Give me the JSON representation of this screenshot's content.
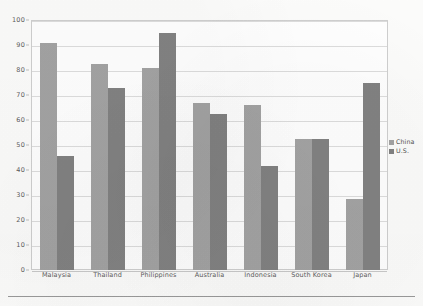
{
  "chart_data": {
    "type": "bar",
    "title": "",
    "subtitle": "",
    "xlabel": "",
    "ylabel": "",
    "ylim": [
      0,
      100
    ],
    "ytick_step": 10,
    "ytick_labels": [
      "0",
      "10",
      "20",
      "30",
      "40",
      "50",
      "60",
      "70",
      "80",
      "90",
      "100"
    ],
    "grid": true,
    "legend_position": "right",
    "categories": [
      "Malaysia",
      "Thailand",
      "Philippines",
      "Australia",
      "Indonesia",
      "South Korea",
      "Japan"
    ],
    "series": [
      {
        "name": "China",
        "color": "#a3a3a3",
        "values": [
          91,
          82.5,
          81,
          67,
          66,
          52.5,
          28.5
        ]
      },
      {
        "name": "U.S.",
        "color": "#828282",
        "values": [
          45.5,
          73,
          95,
          62.5,
          41.5,
          52.5,
          75
        ]
      }
    ]
  },
  "legend": {
    "entries": [
      {
        "label": "China",
        "color": "#a3a3a3"
      },
      {
        "label": "U.S.",
        "color": "#828282"
      }
    ]
  },
  "colors": {
    "series_china": "#a3a3a3",
    "series_us": "#828282",
    "gridline": "#dddddd",
    "frame": "#cfcfcf",
    "axis_text": "#5d5d5d",
    "rule": "#9a9a9a"
  }
}
